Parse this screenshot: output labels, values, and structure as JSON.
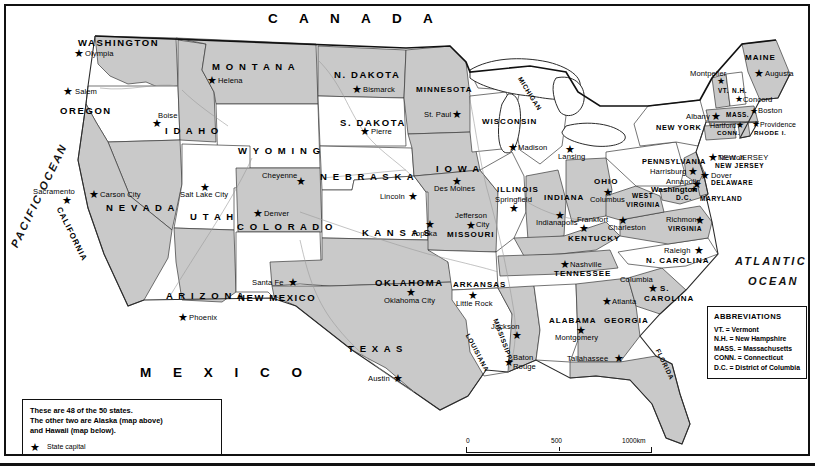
{
  "map": {
    "country_label": "C A N A D A",
    "mexico_label": "M E X I C O",
    "ocean_pacific": "PACIFIC OCEAN",
    "ocean_atlantic_line1": "ATLANTIC",
    "ocean_atlantic_line2": "OCEAN"
  },
  "states": [
    {
      "name": "WASHINGTON",
      "capital": "Olympia"
    },
    {
      "name": "OREGON",
      "capital": "Salem"
    },
    {
      "name": "IDAHO",
      "capital": "Boise"
    },
    {
      "name": "MONTANA",
      "capital": "Helena"
    },
    {
      "name": "WYOMING",
      "capital": "Cheyenne"
    },
    {
      "name": "NEVADA",
      "capital": "Carson City"
    },
    {
      "name": "UTAH",
      "capital": "Salt Lake City"
    },
    {
      "name": "CALIFORNIA",
      "capital": "Sacramento"
    },
    {
      "name": "ARIZONA",
      "capital": "Phoenix"
    },
    {
      "name": "COLORADO",
      "capital": "Denver"
    },
    {
      "name": "NEW MEXICO",
      "capital": "Santa Fe"
    },
    {
      "name": "N. DAKOTA",
      "capital": "Bismarck"
    },
    {
      "name": "S. DAKOTA",
      "capital": "Pierre"
    },
    {
      "name": "NEBRASKA",
      "capital": "Lincoln"
    },
    {
      "name": "KANSAS",
      "capital": "Topeka"
    },
    {
      "name": "OKLAHOMA",
      "capital": "Oklahoma City"
    },
    {
      "name": "TEXAS",
      "capital": "Austin"
    },
    {
      "name": "MINNESOTA",
      "capital": "St. Paul"
    },
    {
      "name": "IOWA",
      "capital": "Des Moines"
    },
    {
      "name": "MISSOURI",
      "capital": "Jefferson City"
    },
    {
      "name": "ARKANSAS",
      "capital": "Little Rock"
    },
    {
      "name": "LOUISIANA",
      "capital": "Baton Rouge"
    },
    {
      "name": "WISCONSIN",
      "capital": "Madison"
    },
    {
      "name": "ILLINOIS",
      "capital": "Springfield"
    },
    {
      "name": "MICHIGAN",
      "capital": "Lansing"
    },
    {
      "name": "INDIANA",
      "capital": "Indianapolis"
    },
    {
      "name": "OHIO",
      "capital": "Columbus"
    },
    {
      "name": "KENTUCKY",
      "capital": "Frankfort"
    },
    {
      "name": "TENNESSEE",
      "capital": "Nashville"
    },
    {
      "name": "MISSISSIPPI",
      "capital": "Jackson"
    },
    {
      "name": "ALABAMA",
      "capital": "Montgomery"
    },
    {
      "name": "GEORGIA",
      "capital": "Atlanta"
    },
    {
      "name": "FLORIDA",
      "capital": "Tallahassee"
    },
    {
      "name": "S. CAROLINA",
      "capital": "Columbia"
    },
    {
      "name": "N. CAROLINA",
      "capital": "Raleigh"
    },
    {
      "name": "VIRGINIA",
      "capital": "Richmond"
    },
    {
      "name": "WEST VIRGINIA",
      "capital": "Charleston"
    },
    {
      "name": "MARYLAND",
      "capital": "Annapolis"
    },
    {
      "name": "DELAWARE",
      "capital": "Dover"
    },
    {
      "name": "PENNSYLVANIA",
      "capital": "Harrisburg"
    },
    {
      "name": "NEW JERSEY",
      "capital": "Trenton"
    },
    {
      "name": "NEW YORK",
      "capital": "Albany"
    },
    {
      "name": "CONN.",
      "capital": "Hartford"
    },
    {
      "name": "RHODE I.",
      "capital": "Providence"
    },
    {
      "name": "MASS.",
      "capital": "Boston"
    },
    {
      "name": "VT.",
      "capital": "Montpelier"
    },
    {
      "name": "N.H.",
      "capital": "Concord"
    },
    {
      "name": "MAINE",
      "capital": "Augusta"
    },
    {
      "name": "D.C.",
      "capital": "Washington"
    }
  ],
  "labels": {
    "washington": "WASHINGTON",
    "olympia": "Olympia",
    "oregon": "OREGON",
    "salem": "Salem",
    "idaho": "I D A H O",
    "boise": "Boise",
    "montana": "M O N T A N A",
    "helena": "Helena",
    "wyoming": "W Y O M I N G",
    "cheyenne": "Cheyenne",
    "nevada": "N E V A D A",
    "carson_city": "Carson City",
    "utah": "U T A H",
    "salt_lake_city": "Salt Lake City",
    "california": "CALIFORNIA",
    "sacramento": "Sacramento",
    "arizona": "A R I Z O N A",
    "phoenix": "Phoenix",
    "colorado": "C O L O R A D O",
    "denver": "Denver",
    "new_mexico": "NEW MEXICO",
    "santa_fe": "Santa Fe",
    "n_dakota": "N. DAKOTA",
    "bismarck": "Bismarck",
    "s_dakota": "S. DAKOTA",
    "pierre": "Pierre",
    "nebraska": "N E B R A S K A",
    "lincoln": "Lincoln",
    "kansas": "K A N S A S",
    "topeka": "Topeka",
    "oklahoma": "OKLAHOMA",
    "oklahoma_city": "Oklahoma City",
    "texas": "T E X A S",
    "austin": "Austin",
    "minnesota": "MINNESOTA",
    "st_paul": "St. Paul",
    "iowa": "I O W A",
    "des_moines": "Des Moines",
    "missouri": "MISSOURI",
    "jefferson_city1": "Jefferson",
    "jefferson_city2": "City",
    "arkansas": "ARKANSAS",
    "little_rock": "Little Rock",
    "louisiana": "LOUISIANA",
    "baton_rouge1": "Baton",
    "baton_rouge2": "Rouge",
    "wisconsin": "WISCONSIN",
    "madison": "Madison",
    "illinois": "ILLINOIS",
    "springfield": "Springfield",
    "michigan": "MICHIGAN",
    "lansing": "Lansing",
    "indiana": "INDIANA",
    "indianapolis": "Indianapolis",
    "ohio": "OHIO",
    "columbus": "Columbus",
    "kentucky": "KENTUCKY",
    "frankfort": "Frankfort",
    "tennessee": "TENNESSEE",
    "nashville": "Nashville",
    "mississippi": "MISSISSIPPI",
    "jackson": "Jackson",
    "alabama": "ALABAMA",
    "montgomery": "Montgomery",
    "georgia": "GEORGIA",
    "atlanta": "Atlanta",
    "florida": "FLORIDA",
    "tallahassee": "Tallahassee",
    "s_carolina1": "S.",
    "s_carolina2": "CAROLINA",
    "columbia": "Columbia",
    "n_carolina": "N. CAROLINA",
    "raleigh": "Raleigh",
    "virginia": "VIRGINIA",
    "richmond": "Richmond",
    "west": "WEST",
    "virginia2": "VIRGINIA",
    "charleston": "Charleston",
    "maryland": "MARYLAND",
    "annapolis": "Annapolis",
    "delaware": "DELAWARE",
    "dover": "Dover",
    "pennsylvania": "PENNSYLVANIA",
    "harrisburg": "Harrisburg",
    "new_jersey": "NEW JERSEY",
    "trenton": "Trenton",
    "new_york": "NEW YORK",
    "albany": "Albany",
    "conn": "CONN.",
    "hartford": "Hartford",
    "rhode_i": "RHODE I.",
    "providence": "Providence",
    "mass": "MASS.",
    "boston": "Boston",
    "vt": "VT.",
    "montpelier": "Montpelier",
    "nh": "N.H.",
    "concord": "Concord",
    "maine": "MAINE",
    "augusta": "Augusta",
    "dc": "D.C.",
    "washington_dc": "Washington"
  },
  "abbreviations": {
    "title": "ABBREVIATIONS",
    "items": [
      "VT. = Vermont",
      "N.H. = New Hampshire",
      "MASS. = Massachusetts",
      "CONN. = Connecticut",
      "D.C. = District of Columbia"
    ]
  },
  "note": {
    "line1": "These are 48 of the 50 states.",
    "line2": "The other two are Alaska (map above)",
    "line3": "and Hawaii (map below).",
    "legend_star": "★",
    "legend_text": "State capital"
  },
  "scale": {
    "tick0": "0",
    "tick500": "500",
    "tick1000": "1000km"
  },
  "colors": {
    "land_light": "#ffffff",
    "land_shaded": "#c9c9c9",
    "border": "#111111",
    "water": "#ffffff"
  }
}
